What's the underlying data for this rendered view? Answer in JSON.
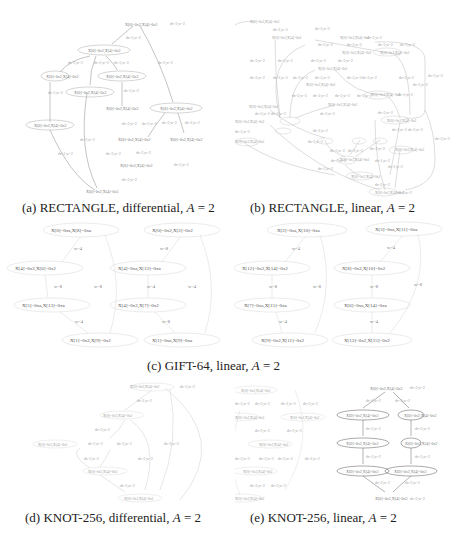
{
  "figure": {
    "panels": [
      {
        "id": "a",
        "caption_prefix": "(a) RECTANGLE, differential, ",
        "caption_var": "A",
        "caption_suffix": " = 2"
      },
      {
        "id": "b",
        "caption_prefix": "(b) RECTANGLE, linear, ",
        "caption_var": "A",
        "caption_suffix": " = 2"
      },
      {
        "id": "c",
        "caption_prefix": "(c) GIFT-64, linear, ",
        "caption_var": "A",
        "caption_suffix": " = 2"
      },
      {
        "id": "d",
        "caption_prefix": "(d) KNOT-256, differential, ",
        "caption_var": "A",
        "caption_suffix": " = 2"
      },
      {
        "id": "e",
        "caption_prefix": "(e) KNOT-256, linear, ",
        "caption_var": "A",
        "caption_suffix": " = 2"
      }
    ],
    "gift": {
      "graphs": [
        {
          "nodes": [
            "X[0]=0xa,X[8]=0xa",
            "X[4]=0x2,X[6]=0x2",
            "X[5]=0xa,X[13]=0xa",
            "X[1]=0x2,X[9]=0x2"
          ],
          "edges": [
            "w=4",
            "w=8",
            "w=4"
          ],
          "back": "w=8"
        },
        {
          "nodes": [
            "X[0]=0x2,X[2]=0x2",
            "X[4]=0xa,X[12]=0xa",
            "X[4]=0x2,X[7]=0x2",
            "X[1]=0xa,X[9]=0xa"
          ],
          "edges": [
            "w=8",
            "w=4",
            "w=8"
          ],
          "back": "w=4"
        },
        {
          "nodes": [
            "X[2]=0xa,X[10]=0xa",
            "X[12]=0x2,X[14]=0x2",
            "X[7]=0xa,X[15]=0xa",
            "X[9]=0x2,X[11]=0x2"
          ],
          "edges": [
            "w=4",
            "w=8",
            "w=4"
          ],
          "back": "w=8"
        },
        {
          "nodes": [
            "X[3]=0xa,X[11]=0xa",
            "X[8]=0x2,X[10]=0x2",
            "X[6]=0xa,X[14]=0xa",
            "X[13]=0x2,X[15]=0x2"
          ],
          "edges": [
            "w=4",
            "w=8",
            "w=4"
          ],
          "back": "w=8"
        }
      ]
    },
    "small_labels": {
      "node": "X[0]=0x2,X[4]=0x2",
      "edge": "dx=2,w=2"
    }
  }
}
